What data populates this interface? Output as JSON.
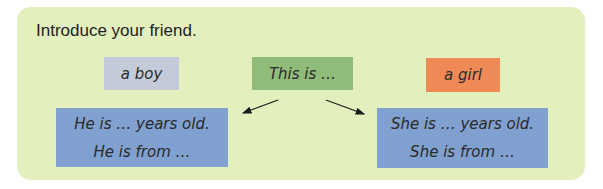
{
  "title": "Introduce your friend.",
  "boxes": {
    "boy": "a boy",
    "this_is": "This is …",
    "girl": "a girl",
    "he_lines": [
      "He is … years old.",
      "He is from …"
    ],
    "she_lines": [
      "She is … years old.",
      "She is from …"
    ]
  },
  "colors": {
    "panel": "#e3efbd",
    "boy": "#c3cbd8",
    "this_is": "#8fbc79",
    "girl": "#ef8a56",
    "sentence_boxes": "#80a1cf"
  }
}
